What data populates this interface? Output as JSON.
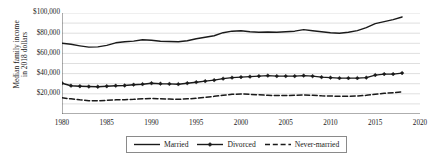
{
  "chart_data": {
    "type": "line",
    "title": "",
    "subtitle": "",
    "xlabel": "",
    "ylabel": "Median family income in 2018 dollars",
    "ylabel_line1": "Median family income",
    "ylabel_line2": "in 2018 dollars",
    "xlim": [
      1980,
      2020
    ],
    "ylim": [
      0,
      100000
    ],
    "grid": true,
    "grid_minor_step": 10000,
    "legend_position": "bottom-center",
    "y_ticks": [
      20000,
      40000,
      60000,
      80000,
      100000
    ],
    "y_ticklabels": [
      "$20,000",
      "$40,000",
      "$60,000",
      "$80,000",
      "$100,000"
    ],
    "x_ticks": [
      1980,
      1985,
      1990,
      1995,
      2000,
      2005,
      2010,
      2015,
      2020
    ],
    "x_ticklabels": [
      "1980",
      "1985",
      "1990",
      "1995",
      "2000",
      "2005",
      "2010",
      "2015",
      "2020"
    ],
    "x": [
      1980,
      1981,
      1982,
      1983,
      1984,
      1985,
      1986,
      1987,
      1988,
      1989,
      1990,
      1991,
      1992,
      1993,
      1994,
      1995,
      1996,
      1997,
      1998,
      1999,
      2000,
      2001,
      2002,
      2003,
      2004,
      2005,
      2006,
      2007,
      2008,
      2009,
      2010,
      2011,
      2012,
      2013,
      2014,
      2015,
      2016,
      2017,
      2018
    ],
    "series": [
      {
        "name": "Married",
        "style": "solid",
        "marker": "none",
        "color": "#1a1a1a",
        "values": [
          70000,
          69000,
          67500,
          66200,
          66500,
          68000,
          70500,
          71500,
          72200,
          73500,
          73000,
          72000,
          71800,
          71500,
          72500,
          74500,
          76000,
          77500,
          80500,
          82000,
          82500,
          81500,
          81000,
          81200,
          81000,
          81500,
          82000,
          83500,
          82500,
          81500,
          80500,
          80000,
          81000,
          82500,
          85500,
          89500,
          91500,
          93500,
          96000
        ]
      },
      {
        "name": "Divorced",
        "style": "solid",
        "marker": "diamond",
        "color": "#1a1a1a",
        "values": [
          30500,
          28000,
          27500,
          27200,
          27000,
          27500,
          28000,
          28200,
          29000,
          29500,
          30500,
          30000,
          29800,
          29500,
          30500,
          31500,
          32500,
          33500,
          35000,
          36000,
          36500,
          37000,
          37500,
          38000,
          37500,
          37500,
          37500,
          38000,
          37500,
          36500,
          36000,
          35500,
          35500,
          35500,
          36000,
          38500,
          39500,
          39500,
          40500
        ]
      },
      {
        "name": "Never-married",
        "style": "dashed",
        "marker": "none",
        "color": "#1a1a1a",
        "values": [
          16000,
          15000,
          14000,
          13200,
          13000,
          13500,
          14000,
          14200,
          14500,
          15000,
          15500,
          15000,
          14800,
          14500,
          15000,
          15500,
          16500,
          17500,
          18500,
          19500,
          19800,
          19500,
          19000,
          18500,
          18200,
          18200,
          18500,
          18800,
          18500,
          18000,
          17800,
          17500,
          17500,
          17800,
          18500,
          19500,
          20500,
          21000,
          22000
        ]
      }
    ],
    "legend": [
      {
        "label": "Married",
        "style": "solid",
        "marker": "none"
      },
      {
        "label": "Divorced",
        "style": "solid",
        "marker": "diamond"
      },
      {
        "label": "Never-married",
        "style": "dashed",
        "marker": "none"
      }
    ]
  }
}
